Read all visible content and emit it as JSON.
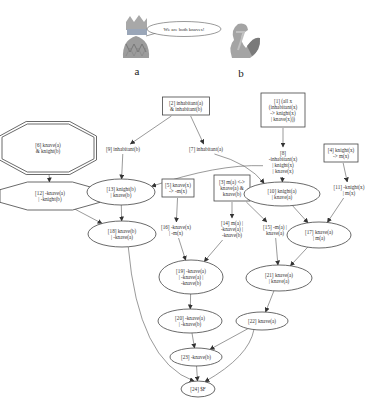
{
  "characters": [
    {
      "id": "a",
      "label": "a",
      "icon": "jester-icon"
    },
    {
      "id": "b",
      "label": "b",
      "icon": "duck-icon"
    }
  ],
  "speech_bubble": "We are both knaves!",
  "nodes": [
    {
      "id": "n1",
      "shape": "box",
      "lines": [
        "[1] (all x",
        "(inhabitant(x)",
        "-> knight(x)",
        "| knave(x)))"
      ]
    },
    {
      "id": "n2",
      "shape": "box",
      "lines": [
        "[2] inhabitant(a)",
        "& inhabitant(b)"
      ]
    },
    {
      "id": "n3",
      "shape": "box",
      "lines": [
        "[3] m(a) <->",
        "knave(a) &",
        "knave(b)"
      ]
    },
    {
      "id": "n4",
      "shape": "box",
      "lines": [
        "[4] knight(x)",
        "-> m(x)"
      ]
    },
    {
      "id": "n5",
      "shape": "box",
      "lines": [
        "[5] knave(x)",
        "-> -m(x)"
      ]
    },
    {
      "id": "n6",
      "shape": "double-octagon",
      "lines": [
        "[6] knave(a)",
        "& knight(b)"
      ]
    },
    {
      "id": "n7",
      "shape": "plain",
      "lines": [
        "[7] inhabitant(a)"
      ]
    },
    {
      "id": "n8",
      "shape": "plain",
      "lines": [
        "[8]",
        "-inhabitant(x)",
        "| knight(x)",
        "| knave(x)"
      ]
    },
    {
      "id": "n9",
      "shape": "plain",
      "lines": [
        "[9] inhabitant(b)"
      ]
    },
    {
      "id": "n10",
      "shape": "ellipse",
      "lines": [
        "[10] knight(a)",
        "| knave(a)"
      ]
    },
    {
      "id": "n11",
      "shape": "plain",
      "lines": [
        "[11] -knight(x)",
        "| m(x)"
      ]
    },
    {
      "id": "n12",
      "shape": "octagon",
      "lines": [
        "[12] -knave(a)",
        "| -knight(b)"
      ]
    },
    {
      "id": "n13",
      "shape": "ellipse",
      "lines": [
        "[13] knight(b)",
        "| knave(b)"
      ]
    },
    {
      "id": "n14",
      "shape": "plain",
      "lines": [
        "[14] m(a) |",
        "-knave(a) |",
        "-knave(b)"
      ]
    },
    {
      "id": "n15",
      "shape": "plain",
      "lines": [
        "[15] -m(a) |",
        "knave(a)"
      ]
    },
    {
      "id": "n16",
      "shape": "plain",
      "lines": [
        "[16] -knave(x)",
        "| -m(x)"
      ]
    },
    {
      "id": "n17",
      "shape": "ellipse",
      "lines": [
        "[17] knave(a)",
        "| m(a)"
      ]
    },
    {
      "id": "n18",
      "shape": "ellipse",
      "lines": [
        "[18] knave(b)",
        "| -knave(a)"
      ]
    },
    {
      "id": "n19",
      "shape": "ellipse",
      "lines": [
        "[19] -knave(a)",
        "| -knave(a) |",
        "-knave(b)"
      ]
    },
    {
      "id": "n20",
      "shape": "ellipse",
      "lines": [
        "[20] -knave(a)",
        "| -knave(b)"
      ]
    },
    {
      "id": "n21",
      "shape": "ellipse",
      "lines": [
        "[21] knave(a)",
        "| knave(a)"
      ]
    },
    {
      "id": "n22",
      "shape": "ellipse",
      "lines": [
        "[22] knave(a)"
      ]
    },
    {
      "id": "n23",
      "shape": "ellipse",
      "lines": [
        "[23] -knave(b)"
      ]
    },
    {
      "id": "n24",
      "shape": "ellipse",
      "lines": [
        "[24] $F"
      ]
    }
  ],
  "edges": [
    [
      "n2",
      "n9"
    ],
    [
      "n2",
      "n7"
    ],
    [
      "n1",
      "n8"
    ],
    [
      "n4",
      "n11"
    ],
    [
      "n6",
      "n12"
    ],
    [
      "n9",
      "n13"
    ],
    [
      "n7",
      "n10"
    ],
    [
      "n8",
      "n10"
    ],
    [
      "n8",
      "n13"
    ],
    [
      "n12",
      "n18"
    ],
    [
      "n13",
      "n18"
    ],
    [
      "n5",
      "n16"
    ],
    [
      "n3",
      "n14"
    ],
    [
      "n3",
      "n15"
    ],
    [
      "n10",
      "n17"
    ],
    [
      "n11",
      "n17"
    ],
    [
      "n16",
      "n19"
    ],
    [
      "n14",
      "n19"
    ],
    [
      "n15",
      "n21"
    ],
    [
      "n17",
      "n21"
    ],
    [
      "n19",
      "n20"
    ],
    [
      "n21",
      "n22"
    ],
    [
      "n20",
      "n23"
    ],
    [
      "n22",
      "n23"
    ],
    [
      "n18",
      "n24"
    ],
    [
      "n23",
      "n24"
    ],
    [
      "n22",
      "n24"
    ]
  ]
}
